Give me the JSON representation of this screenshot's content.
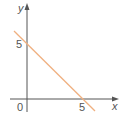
{
  "diagram": {
    "type": "coordinate-graph",
    "axes": {
      "x_label": "x",
      "y_label": "y",
      "origin_label": "0"
    },
    "ticks": {
      "x_tick_label": "5",
      "y_tick_label": "5"
    },
    "line": {
      "description": "straight line through (0,5) and (5,0)",
      "x_intercept": 5,
      "y_intercept": 5,
      "color": "#f0b080"
    },
    "axis_color": "#555555"
  }
}
